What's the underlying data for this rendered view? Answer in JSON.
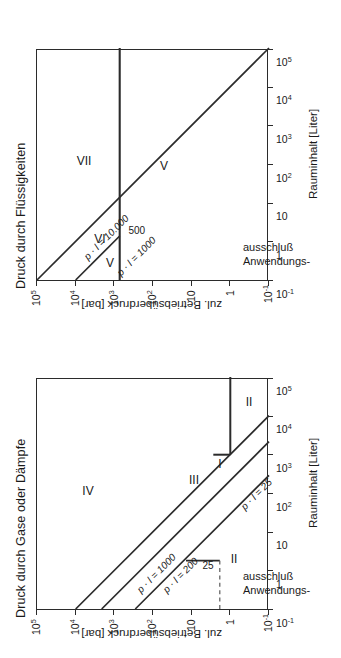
{
  "figure": {
    "orientation": "rotated-90-ccw",
    "ink_color": "#2b2b2b",
    "background": "#ffffff"
  },
  "axes": {
    "x_title": "Rauminhalt [Liter]",
    "y_title": "zul. Betriebsüberdruck [bar]",
    "x_ticks": [
      "10-1",
      "1",
      "10",
      "102",
      "103",
      "104",
      "105"
    ],
    "y_ticks": [
      "10-1",
      "1",
      "10",
      "102",
      "103",
      "104",
      "105"
    ],
    "x_tick_html": [
      "10<sup>-1</sup>",
      "1",
      "10",
      "10<sup>2</sup>",
      "10<sup>3</sup>",
      "10<sup>4</sup>",
      "10<sup>5</sup>"
    ],
    "y_tick_html": [
      "10<sup>-1</sup>",
      "1",
      "10",
      "10<sup>2</sup>",
      "10<sup>3</sup>",
      "10<sup>4</sup>",
      "10<sup>5</sup>"
    ],
    "x_range": [
      -1,
      5
    ],
    "y_range": [
      -1,
      5
    ],
    "scale": "log-log"
  },
  "panels": {
    "gases": {
      "title": "Druck durch Gase oder Dämpfe",
      "exclusion_line1": "Anwendungs-",
      "exclusion_line2": "ausschluß",
      "line_labels": {
        "pl1000": "p · l = 1000",
        "pl200": "p · l = 200",
        "pl25": "p · l = 25",
        "step25": "25"
      },
      "regions": {
        "IV": "IV",
        "III": "III",
        "II_left": "II",
        "II_right": "II",
        "I": "I"
      }
    },
    "liquids": {
      "title": "Druck durch Flüssigkeiten",
      "exclusion_line1": "Anwendungs-",
      "exclusion_line2": "ausschluß",
      "line_labels": {
        "pl10000": "p · l = 10.000",
        "pl1000": "p · l = 1000",
        "vline500": "500"
      },
      "regions": {
        "VII": "VII",
        "VI": "VI",
        "V_left": "V",
        "V_right": "V"
      }
    }
  },
  "chart_data": [
    {
      "type": "line",
      "title": "Druck durch Gase oder Dämpfe",
      "xlabel": "Rauminhalt [Liter]",
      "ylabel": "zul. Betriebsüberdruck [bar]",
      "xscale": "log",
      "yscale": "log",
      "xlim": [
        0.1,
        100000
      ],
      "ylim": [
        0.1,
        100000
      ],
      "xticks": [
        0.1,
        1,
        10,
        100,
        1000,
        10000,
        100000
      ],
      "yticks": [
        0.1,
        1,
        10,
        100,
        1000,
        10000,
        100000
      ],
      "grid": false,
      "legend": "none",
      "series": [
        {
          "name": "p · l = 1000",
          "kind": "iso-pV boundary",
          "constant_product": 1000,
          "points": [
            [
              0.1,
              10000
            ],
            [
              100000,
              0.01
            ]
          ],
          "visible_from": [
            0.1,
            10000
          ],
          "visible_to": [
            10000,
            0.1
          ]
        },
        {
          "name": "p · l = 200",
          "kind": "iso-pV boundary",
          "constant_product": 200,
          "points": [
            [
              0.1,
              2000
            ],
            [
              2000,
              0.1
            ]
          ]
        },
        {
          "name": "p · l = 25",
          "kind": "iso-pV boundary",
          "constant_product": 25,
          "points": [
            [
              0.1,
              250
            ],
            [
              250,
              0.1
            ]
          ]
        },
        {
          "name": "25 bar step",
          "kind": "vertical-segment",
          "x": 1.5,
          "y_from": 25,
          "y_to": 133
        },
        {
          "name": "25 bar guide",
          "kind": "dashed-horizontal",
          "y": 25,
          "x_from": 0.1,
          "x_to": 1.5
        },
        {
          "name": "1 bar boundary",
          "kind": "vertical-segment",
          "x": 1000,
          "y_from": 1,
          "y_to": 4.8
        },
        {
          "name": "1 bar floor",
          "kind": "horizontal-segment",
          "y": 1,
          "x_from": 1000,
          "x_to": 100000
        }
      ],
      "annotations": [
        {
          "text": "IV",
          "x": 60,
          "y": 6000
        },
        {
          "text": "III",
          "x": 90,
          "y": 6
        },
        {
          "text": "II",
          "x": 1.1,
          "y": 3.2
        },
        {
          "text": "I",
          "x": 26,
          "y": 1.9
        },
        {
          "text": "II",
          "x": 12000,
          "y": 0.45
        },
        {
          "text": "25",
          "x": 1.1,
          "y": 55
        },
        {
          "text": "Anwendungs-ausschluß",
          "x": 0.45,
          "y": 0.35
        }
      ]
    },
    {
      "type": "line",
      "title": "Druck durch Flüssigkeiten",
      "xlabel": "Rauminhalt [Liter]",
      "ylabel": "zul. Betriebsüberdruck [bar]",
      "xscale": "log",
      "yscale": "log",
      "xlim": [
        0.1,
        100000
      ],
      "ylim": [
        0.1,
        100000
      ],
      "xticks": [
        0.1,
        1,
        10,
        100,
        1000,
        10000,
        100000
      ],
      "yticks": [
        0.1,
        1,
        10,
        100,
        1000,
        10000,
        100000
      ],
      "grid": false,
      "legend": "none",
      "series": [
        {
          "name": "p · l = 10.000",
          "kind": "iso-pV boundary",
          "constant_product": 10000,
          "points": [
            [
              0.1,
              100000
            ],
            [
              100000,
              0.1
            ]
          ]
        },
        {
          "name": "p · l = 1000",
          "kind": "iso-pV boundary",
          "constant_product": 1000,
          "points": [
            [
              0.1,
              10000
            ],
            [
              10000,
              0.1
            ]
          ],
          "visible_to": [
            2,
            5000
          ]
        },
        {
          "name": "500 bar boundary",
          "kind": "vertical-line",
          "value_bar": 500,
          "x_from": 0.1,
          "x_to": 100000
        }
      ],
      "annotations": [
        {
          "text": "VII",
          "x": 1200,
          "y": 6000
        },
        {
          "text": "VI",
          "x": 2.2,
          "y": 1400
        },
        {
          "text": "V",
          "x": 0.45,
          "y": 700
        },
        {
          "text": "V",
          "x": 1000,
          "y": 180
        },
        {
          "text": "500",
          "x": 3.0,
          "y": 300
        },
        {
          "text": "Anwendungs-ausschluß",
          "x": 0.45,
          "y": 0.35
        }
      ]
    }
  ]
}
